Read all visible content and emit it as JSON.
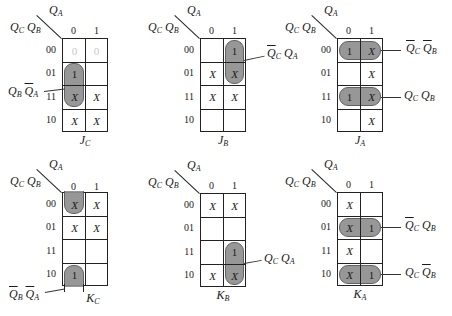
{
  "figure": {
    "col_var": "Q",
    "col_var_sub": "A",
    "row_vars": [
      {
        "v": "Q",
        "s": "C"
      },
      {
        "v": "Q",
        "s": "B"
      }
    ],
    "col_labels": [
      "0",
      "1"
    ],
    "row_labels": [
      "00",
      "01",
      "11",
      "10"
    ]
  },
  "maps": [
    {
      "name": "J",
      "name_sub": "C",
      "cells": [
        [
          "0",
          "0"
        ],
        [
          "1",
          ""
        ],
        [
          "X",
          "X"
        ],
        [
          "X",
          "X"
        ]
      ],
      "faint_first_row": true,
      "groups": [
        {
          "term": [
            {
              "v": "Q",
              "s": "B",
              "bar": false
            },
            {
              "v": "Q",
              "s": "A",
              "bar": true
            }
          ],
          "side": "left"
        }
      ]
    },
    {
      "name": "J",
      "name_sub": "B",
      "cells": [
        [
          "",
          "1"
        ],
        [
          "X",
          "X"
        ],
        [
          "X",
          "X"
        ],
        [
          "",
          ""
        ]
      ],
      "groups": [
        {
          "term": [
            {
              "v": "Q",
              "s": "C",
              "bar": true
            },
            {
              "v": "Q",
              "s": "A",
              "bar": false
            }
          ],
          "side": "right"
        }
      ]
    },
    {
      "name": "J",
      "name_sub": "A",
      "cells": [
        [
          "1",
          "X"
        ],
        [
          "",
          "X"
        ],
        [
          "1",
          "X"
        ],
        [
          "",
          "X"
        ]
      ],
      "groups": [
        {
          "term": [
            {
              "v": "Q",
              "s": "C",
              "bar": true
            },
            {
              "v": "Q",
              "s": "B",
              "bar": true
            }
          ],
          "side": "right"
        },
        {
          "term": [
            {
              "v": "Q",
              "s": "C",
              "bar": false
            },
            {
              "v": "Q",
              "s": "B",
              "bar": false
            }
          ],
          "side": "right"
        }
      ]
    },
    {
      "name": "K",
      "name_sub": "C",
      "cells": [
        [
          "X",
          "X"
        ],
        [
          "X",
          "X"
        ],
        [
          "",
          ""
        ],
        [
          "1",
          ""
        ]
      ],
      "groups": [
        {
          "term": [
            {
              "v": "Q",
              "s": "B",
              "bar": true
            },
            {
              "v": "Q",
              "s": "A",
              "bar": true
            }
          ],
          "side": "left"
        }
      ]
    },
    {
      "name": "K",
      "name_sub": "B",
      "cells": [
        [
          "X",
          "X"
        ],
        [
          "",
          ""
        ],
        [
          "",
          "1"
        ],
        [
          "X",
          "X"
        ]
      ],
      "groups": [
        {
          "term": [
            {
              "v": "Q",
              "s": "C",
              "bar": false
            },
            {
              "v": "Q",
              "s": "A",
              "bar": false
            }
          ],
          "side": "right"
        }
      ]
    },
    {
      "name": "K",
      "name_sub": "A",
      "cells": [
        [
          "X",
          ""
        ],
        [
          "X",
          "1"
        ],
        [
          "X",
          ""
        ],
        [
          "X",
          "1"
        ]
      ],
      "groups": [
        {
          "term": [
            {
              "v": "Q",
              "s": "C",
              "bar": true
            },
            {
              "v": "Q",
              "s": "B",
              "bar": false
            }
          ],
          "side": "right"
        },
        {
          "term": [
            {
              "v": "Q",
              "s": "C",
              "bar": false
            },
            {
              "v": "Q",
              "s": "B",
              "bar": true
            }
          ],
          "side": "right"
        }
      ]
    }
  ],
  "labels": {
    "m0_g0": "Q_B Q̄_A",
    "m1_g0": "Q̄_C Q_A",
    "m2_g0": "Q̄_C Q̄_B",
    "m2_g1": "Q_C Q_B",
    "m3_g0": "Q̄_B Q̄_A",
    "m4_g0": "Q_C Q_A",
    "m5_g0": "Q̄_C Q_B",
    "m5_g1": "Q_C Q̄_B"
  }
}
